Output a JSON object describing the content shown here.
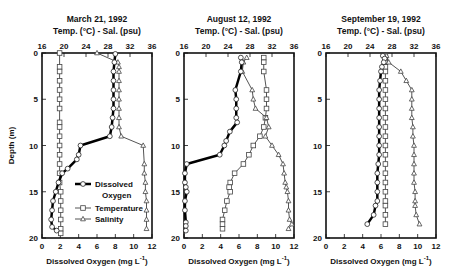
{
  "chart_data": [
    {
      "type": "line",
      "title": "March 21, 1992",
      "top_axis_label": "Temp. (°C) - Sal. (psu)",
      "top_axis_range": [
        16,
        36
      ],
      "top_ticks": [
        "16",
        "20",
        "24",
        "28",
        "32",
        "36"
      ],
      "xlabel": "Dissolved Oxygen (mg L⁻¹)",
      "x_range": [
        0,
        12
      ],
      "x_ticks": [
        "0",
        "2",
        "4",
        "6",
        "8",
        "10",
        "12"
      ],
      "ylabel": "Depth (m)",
      "y_range": [
        0,
        20
      ],
      "y_ticks": [
        "0",
        "5",
        "10",
        "15",
        "20"
      ],
      "y_inverted": true,
      "legend": [
        "Dissolved Oxygen",
        "Temperature",
        "Salinity"
      ],
      "series": [
        {
          "name": "Dissolved Oxygen",
          "axis": "bottom",
          "marker": "circle",
          "linewidth": 2.5,
          "depth": [
            0.1,
            1,
            2,
            3,
            4,
            5,
            6,
            7,
            8,
            9,
            10,
            11,
            11.5,
            12.5,
            13,
            14,
            15,
            16,
            17,
            18,
            18.8,
            19.2
          ],
          "values": [
            8.0,
            7.9,
            7.8,
            7.8,
            7.8,
            7.8,
            7.8,
            7.7,
            7.6,
            7.4,
            4.2,
            4.0,
            3.8,
            2.8,
            2.2,
            1.8,
            1.5,
            1.2,
            1.1,
            1.0,
            1.1,
            1.6
          ]
        },
        {
          "name": "Temperature",
          "axis": "top",
          "marker": "square",
          "linewidth": 1,
          "depth": [
            0,
            1.5,
            2,
            3,
            4,
            5,
            6,
            7.5,
            8,
            9,
            10,
            11,
            12,
            13,
            14,
            15,
            16,
            17,
            18,
            19,
            19.5
          ],
          "values": [
            19.2,
            19.2,
            19.2,
            19.2,
            19.2,
            19.2,
            19.2,
            19.2,
            19.2,
            19.2,
            19.2,
            19.2,
            19.2,
            19.2,
            19.2,
            19.4,
            19.4,
            19.4,
            19.4,
            19.4,
            19.4
          ]
        },
        {
          "name": "Salinity",
          "axis": "top",
          "marker": "triangle",
          "linewidth": 1,
          "depth": [
            0,
            1,
            1.5,
            2,
            3,
            4,
            5,
            6,
            7,
            8,
            9,
            10,
            12,
            13,
            14,
            15,
            16,
            17,
            18,
            19
          ],
          "values": [
            26.0,
            29.8,
            30.0,
            30.0,
            30.0,
            30.0,
            30.0,
            30.0,
            30.0,
            30.0,
            30.4,
            34.4,
            34.6,
            34.6,
            34.8,
            34.8,
            35.0,
            35.0,
            35.0,
            35.0
          ]
        }
      ]
    },
    {
      "type": "line",
      "title": "August 12, 1992",
      "top_axis_label": "Temp. (°C) - Sal. (psu)",
      "top_axis_range": [
        16,
        36
      ],
      "top_ticks": [
        "16",
        "20",
        "24",
        "28",
        "32",
        "36"
      ],
      "xlabel": "Dissolved Oxygen (mg L⁻¹)",
      "x_range": [
        0,
        12
      ],
      "x_ticks": [
        "0",
        "2",
        "4",
        "6",
        "8",
        "10",
        "12"
      ],
      "ylabel": "",
      "y_range": [
        0,
        20
      ],
      "y_ticks": [
        "0",
        "5",
        "10",
        "15",
        "20"
      ],
      "y_inverted": true,
      "series": [
        {
          "name": "Dissolved Oxygen",
          "axis": "bottom",
          "marker": "circle",
          "linewidth": 2.5,
          "depth": [
            0.5,
            1,
            2,
            4,
            5,
            6,
            7,
            7.5,
            8.5,
            9.5,
            10,
            11,
            12,
            13,
            14,
            14.5,
            15,
            16,
            17,
            18.3,
            18.7,
            19.2
          ],
          "values": [
            6.2,
            6.3,
            6.2,
            5.6,
            5.7,
            5.7,
            5.7,
            5.8,
            5.0,
            4.6,
            4.4,
            3.9,
            0.3,
            0.1,
            0.1,
            0.2,
            0.3,
            0.1,
            0.1,
            0.2,
            0.2,
            0.2
          ]
        },
        {
          "name": "Temperature",
          "axis": "top",
          "marker": "square",
          "linewidth": 1,
          "depth": [
            0.5,
            1,
            2,
            4,
            5,
            6,
            7,
            8,
            9,
            10,
            11,
            12,
            13,
            14,
            14.5,
            15,
            16,
            17,
            18,
            18.5,
            19
          ],
          "values": [
            30.5,
            30.5,
            30.5,
            31.0,
            31.0,
            31.0,
            30.8,
            30.5,
            29.8,
            28.6,
            27.8,
            26.8,
            25.2,
            24.4,
            24.2,
            24.4,
            23.8,
            23.4,
            23.0,
            23.0,
            23.0
          ]
        },
        {
          "name": "Salinity",
          "axis": "top",
          "marker": "triangle",
          "linewidth": 1,
          "depth": [
            0.5,
            1,
            2,
            4,
            5,
            6,
            7,
            8,
            9,
            10,
            11,
            12,
            13,
            14,
            14.5,
            15,
            16,
            17,
            18,
            18.5,
            19
          ],
          "values": [
            27.4,
            26.8,
            26.6,
            28.4,
            28.6,
            29.0,
            31.0,
            31.4,
            30.8,
            32.0,
            33.2,
            34.0,
            34.2,
            34.4,
            34.6,
            34.8,
            35.0,
            35.0,
            35.2,
            35.6,
            35.0
          ]
        }
      ]
    },
    {
      "type": "line",
      "title": "September 19, 1992",
      "top_axis_label": "Temp. (°C) - Sal. (psu)",
      "top_axis_range": [
        16,
        36
      ],
      "top_ticks": [
        "16",
        "20",
        "24",
        "28",
        "32",
        "36"
      ],
      "xlabel": "Dissolved Oxygen (mg L⁻¹)",
      "x_range": [
        0,
        12
      ],
      "x_ticks": [
        "0",
        "2",
        "4",
        "6",
        "8",
        "10",
        "12"
      ],
      "ylabel": "",
      "y_range": [
        0,
        20
      ],
      "y_ticks": [
        "0",
        "5",
        "10",
        "15",
        "20"
      ],
      "y_inverted": true,
      "series": [
        {
          "name": "Dissolved Oxygen",
          "axis": "bottom",
          "marker": "circle",
          "linewidth": 2.5,
          "depth": [
            0.3,
            0.6,
            1,
            1.5,
            2,
            3,
            4,
            5,
            6,
            7,
            8,
            9,
            10,
            11,
            12,
            13,
            14,
            15,
            16,
            16.5,
            17.5,
            18.5
          ],
          "values": [
            6.2,
            6.4,
            6.3,
            6.1,
            6.0,
            5.9,
            5.8,
            5.8,
            5.8,
            5.8,
            5.8,
            5.8,
            5.8,
            5.8,
            5.7,
            5.6,
            5.6,
            5.6,
            5.6,
            5.4,
            5.2,
            4.5
          ]
        },
        {
          "name": "Temperature",
          "axis": "top",
          "marker": "square",
          "linewidth": 1,
          "depth": [
            0.3,
            0.6,
            1,
            1.5,
            2,
            3,
            4,
            5,
            6,
            7,
            8,
            9,
            10,
            11,
            12,
            13,
            14,
            15,
            16,
            16.5,
            17.5,
            18.5
          ],
          "values": [
            26.8,
            26.8,
            26.8,
            26.8,
            26.8,
            26.8,
            26.8,
            26.8,
            26.8,
            26.8,
            26.8,
            26.8,
            26.8,
            26.8,
            26.8,
            26.8,
            26.8,
            26.8,
            26.8,
            26.8,
            26.8,
            26.8
          ]
        },
        {
          "name": "Salinity",
          "axis": "top",
          "marker": "triangle",
          "linewidth": 1,
          "depth": [
            0.3,
            1,
            2,
            3,
            4,
            5,
            6,
            7,
            8,
            9,
            10,
            11,
            12,
            13,
            14,
            15,
            16,
            16.5,
            17.5,
            18.5
          ],
          "values": [
            27.0,
            27.4,
            29.6,
            30.6,
            31.6,
            31.6,
            31.6,
            31.6,
            31.8,
            31.8,
            32.0,
            32.0,
            32.0,
            32.0,
            32.0,
            32.2,
            32.2,
            32.2,
            32.4,
            33.0
          ]
        }
      ]
    }
  ],
  "legend": {
    "items": [
      {
        "label_line1": "Dissolved",
        "label_line2": "Oxygen",
        "style": "thick-circle"
      },
      {
        "label_line1": "Temperature",
        "style": "thin-square"
      },
      {
        "label_line1": "Salinity",
        "style": "thin-triangle"
      }
    ]
  }
}
